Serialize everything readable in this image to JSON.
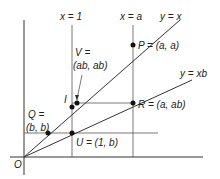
{
  "diagram": {
    "lines": {
      "x_eq_1": "x = 1",
      "x_eq_a": "x = a",
      "y_eq_x": "y = x",
      "y_eq_xb": "y = xb"
    },
    "points": {
      "origin": "O",
      "P": "P = (a, a)",
      "R": "R = (a, ab)",
      "U": "U = (1, b)",
      "I": "I",
      "V_line1": "V =",
      "V_line2": "(ab, ab)",
      "Q_line1": "Q =",
      "Q_line2": "(b, b)"
    }
  }
}
